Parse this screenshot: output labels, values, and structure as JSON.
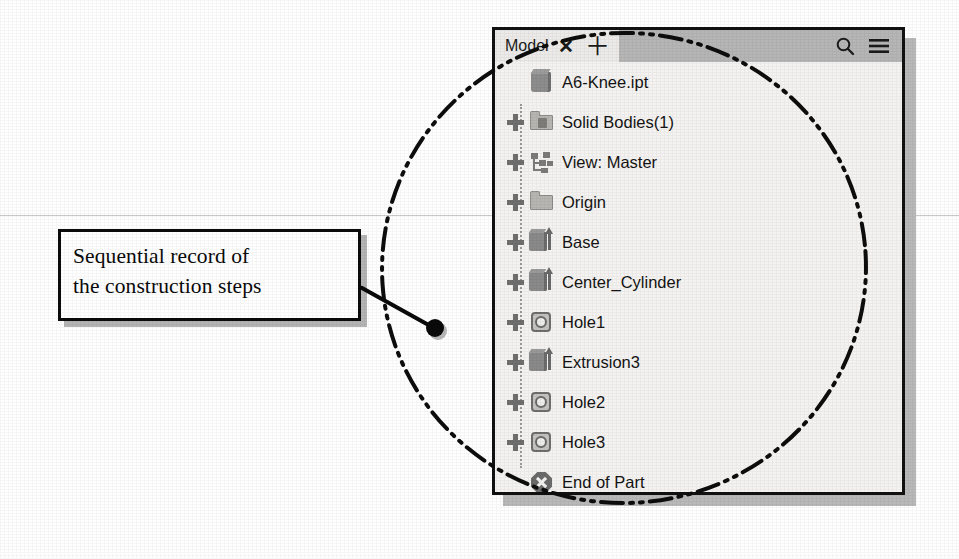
{
  "annotation": {
    "callout_lines": [
      "Sequential record of",
      "the construction steps"
    ],
    "leader_label": "leader-line-to-model-tree"
  },
  "panel": {
    "header": {
      "tab_label": "Model",
      "close_label": "✕",
      "add_label": "＋",
      "search_icon": "search-icon",
      "menu_icon": "hamburger-menu-icon"
    },
    "tree": [
      {
        "label": "A6-Knee.ipt",
        "icon": "part-document-icon",
        "expandable": false
      },
      {
        "label": "Solid Bodies(1)",
        "icon": "folder-solid-bodies-icon",
        "expandable": true
      },
      {
        "label": "View: Master",
        "icon": "view-hierarchy-icon",
        "expandable": true
      },
      {
        "label": "Origin",
        "icon": "folder-icon",
        "expandable": true
      },
      {
        "label": "Base",
        "icon": "extrusion-icon",
        "expandable": true
      },
      {
        "label": "Center_Cylinder",
        "icon": "extrusion-icon",
        "expandable": true
      },
      {
        "label": "Hole1",
        "icon": "hole-icon",
        "expandable": true
      },
      {
        "label": "Extrusion3",
        "icon": "extrusion-icon",
        "expandable": true
      },
      {
        "label": "Hole2",
        "icon": "hole-icon",
        "expandable": true
      },
      {
        "label": "Hole3",
        "icon": "hole-icon",
        "expandable": true
      },
      {
        "label": "End of Part",
        "icon": "end-of-part-icon",
        "expandable": false
      }
    ]
  },
  "colors": {
    "panel_border": "#111111",
    "panel_background": "#f4f3f1",
    "header_tab": "#ecebe9",
    "header_bar": "#b6b6b6",
    "shadow": "#b9b9b9",
    "ink": "#0a0a0a"
  }
}
